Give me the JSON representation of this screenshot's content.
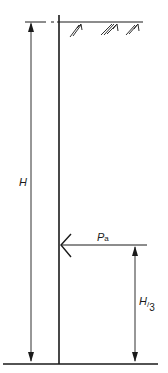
{
  "diagram": {
    "type": "retaining-wall-active-earth-pressure",
    "labels": {
      "height": "H",
      "force": "P",
      "force_subscript": "a",
      "force_height_num": "H",
      "force_height_sep": "/",
      "force_height_den": "3"
    },
    "colors": {
      "line": "#1a1a1a",
      "background": "#ffffff"
    }
  }
}
